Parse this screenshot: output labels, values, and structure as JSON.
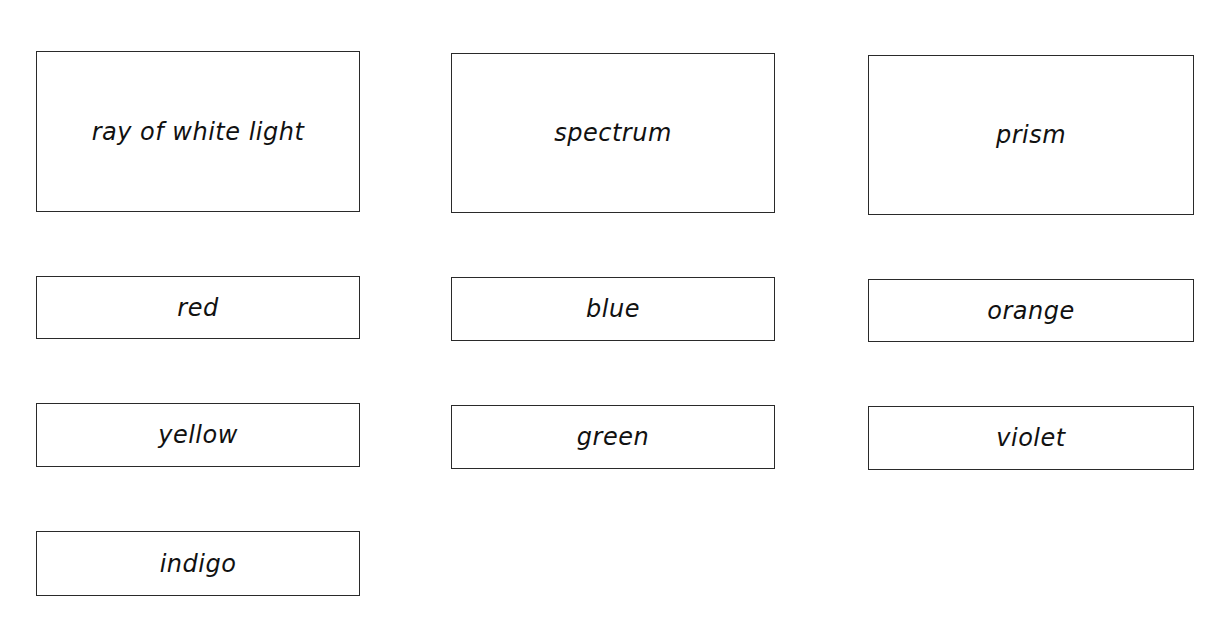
{
  "worksheet": {
    "cards": [
      {
        "id": "ray-of-white-light",
        "label": "ray of white light",
        "size": "large"
      },
      {
        "id": "spectrum",
        "label": "spectrum",
        "size": "large"
      },
      {
        "id": "prism",
        "label": "prism",
        "size": "large"
      },
      {
        "id": "red",
        "label": "red",
        "size": "small"
      },
      {
        "id": "blue",
        "label": "blue",
        "size": "small"
      },
      {
        "id": "orange",
        "label": "orange",
        "size": "small"
      },
      {
        "id": "yellow",
        "label": "yellow",
        "size": "small"
      },
      {
        "id": "green",
        "label": "green",
        "size": "small"
      },
      {
        "id": "violet",
        "label": "violet",
        "size": "small"
      },
      {
        "id": "indigo",
        "label": "indigo",
        "size": "small"
      }
    ],
    "colors": {
      "border": "#2a2a2a",
      "text": "#111111",
      "background": "#ffffff"
    }
  }
}
